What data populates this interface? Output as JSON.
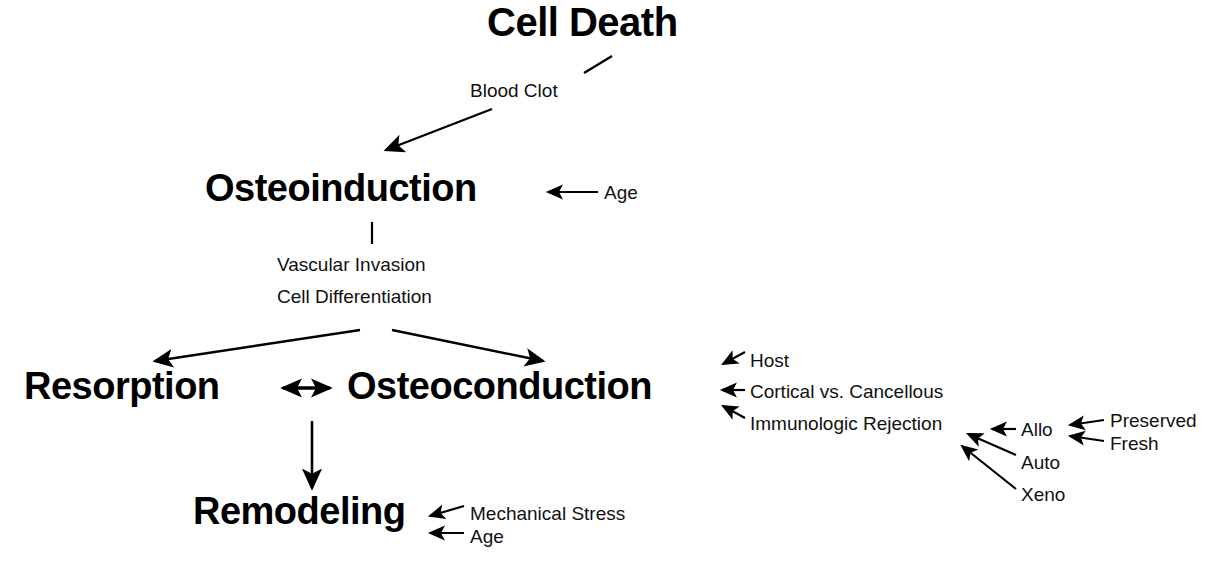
{
  "diagram": {
    "title": "Cell Death",
    "nodes": [
      {
        "id": "cell_death",
        "label": "Cell Death"
      },
      {
        "id": "osteoinduction",
        "label": "Osteoinduction"
      },
      {
        "id": "resorption",
        "label": "Resorption"
      },
      {
        "id": "osteoconduction",
        "label": "Osteoconduction"
      },
      {
        "id": "remodeling",
        "label": "Remodeling"
      }
    ],
    "labels": {
      "blood_clot": "Blood Clot",
      "age_osteoinduction": "Age",
      "vascular_invasion": "Vascular Invasion",
      "cell_differentiation": "Cell Differentiation",
      "host": "Host",
      "cortical_vs_cancellous": "Cortical vs. Cancellous",
      "immunologic_rejection": "Immunologic Rejection",
      "allo": "Allo",
      "auto": "Auto",
      "xeno": "Xeno",
      "preserved": "Preserved",
      "fresh": "Fresh",
      "mechanical_stress": "Mechanical Stress",
      "age_remodeling": "Age"
    },
    "colors": {
      "background": "#ffffff",
      "ink": "#000000",
      "label_ink": "#111111"
    }
  }
}
